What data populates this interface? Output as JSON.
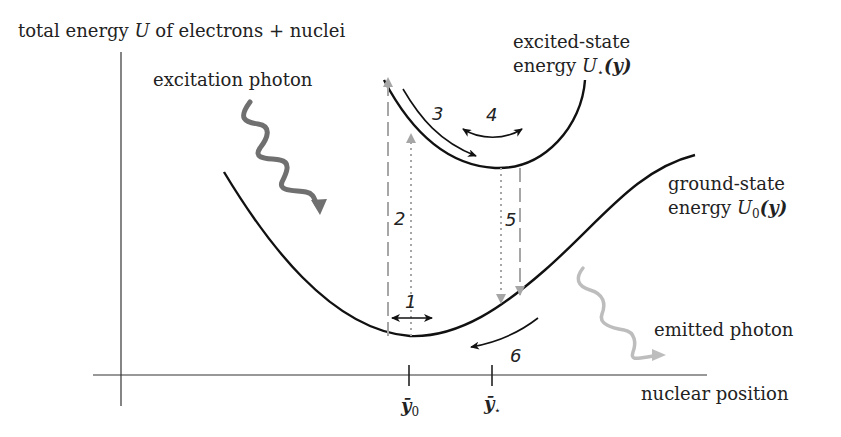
{
  "labels": {
    "y_axis": "total energy U of electrons + nuclei",
    "y_axis_pre": "total energy ",
    "y_axis_var": "U",
    "y_axis_post": " of electrons + nuclei",
    "x_axis": "nuclear position",
    "excitation": "excitation photon",
    "emitted": "emitted photon",
    "excited_line1": "excited-state",
    "excited_line2_pre": "energy ",
    "excited_var": "U",
    "excited_sub": "⋆",
    "excited_arg": "(y)",
    "ground_line1": "ground-state",
    "ground_line2_pre": "energy ",
    "ground_var": "U",
    "ground_sub": "0",
    "ground_arg": "(y)",
    "tick_y0": "ȳ",
    "tick_y0_sub": "0",
    "tick_ystar": "ȳ",
    "tick_ystar_sub": "⋆"
  },
  "steps": [
    "1",
    "2",
    "3",
    "4",
    "5",
    "6"
  ],
  "colors": {
    "curve": "#111111",
    "axis": "#333333",
    "transition_arrow": "#a6a6a6",
    "excitation_photon": "#707070",
    "emitted_photon": "#bdbdbd"
  }
}
